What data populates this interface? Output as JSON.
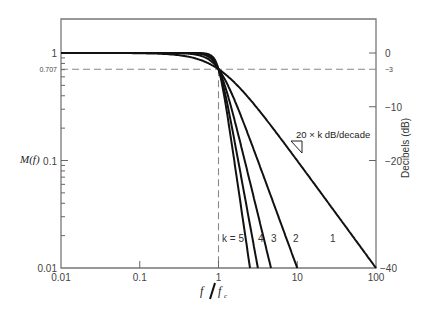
{
  "chart_data": {
    "type": "line",
    "title": "",
    "xlabel": "f / f_c",
    "ylabel": "M(f)",
    "y2label": "Decibels (dB)",
    "xscale": "log",
    "yscale": "log",
    "xlim": [
      0.01,
      100
    ],
    "ylim": [
      0.01,
      1.5
    ],
    "grid": false,
    "legend": "none (inline curve labels)",
    "x_ticks": [
      {
        "value": 0.01,
        "label": "0.01"
      },
      {
        "value": 0.1,
        "label": "0.1"
      },
      {
        "value": 1,
        "label": "1"
      },
      {
        "value": 10,
        "label": "10"
      },
      {
        "value": 100,
        "label": "100"
      }
    ],
    "y_ticks": [
      {
        "value": 1,
        "label": "1"
      },
      {
        "value": 0.707,
        "label": "0.707"
      },
      {
        "value": 0.1,
        "label": "0.1"
      },
      {
        "value": 0.01,
        "label": "0.01"
      }
    ],
    "y2_ticks": [
      {
        "value": 1,
        "label": "0"
      },
      {
        "value": 0.707,
        "label": "−3"
      },
      {
        "value": 0.3162,
        "label": "−10"
      },
      {
        "value": 0.1,
        "label": "−20"
      },
      {
        "value": 0.01,
        "label": "−40"
      }
    ],
    "reference_lines": [
      {
        "type": "horizontal",
        "value": 0.707,
        "style": "dashed"
      },
      {
        "type": "vertical",
        "value": 1,
        "style": "dashed"
      }
    ],
    "formula": "M(f) = 1 / sqrt(1 + (f/fc)^(2k))",
    "series": [
      {
        "name": "k = 1",
        "label": "1",
        "k": 1,
        "x": [
          0.01,
          0.1,
          0.5,
          1,
          2,
          5,
          10,
          100
        ],
        "values": [
          1.0,
          0.995,
          0.894,
          0.707,
          0.447,
          0.196,
          0.0995,
          0.01
        ],
        "label_at": [
          330,
          242
        ]
      },
      {
        "name": "k = 2",
        "label": "2",
        "k": 2,
        "x": [
          0.01,
          0.1,
          0.5,
          1,
          2,
          5,
          10
        ],
        "values": [
          1.0,
          1.0,
          0.97,
          0.707,
          0.243,
          0.04,
          0.01
        ],
        "label_at": [
          293,
          242
        ]
      },
      {
        "name": "k = 3",
        "label": "3",
        "k": 3,
        "x": [
          0.01,
          0.1,
          0.5,
          1,
          2,
          4.64
        ],
        "values": [
          1.0,
          1.0,
          0.992,
          0.707,
          0.124,
          0.01
        ],
        "label_at": [
          271,
          242
        ]
      },
      {
        "name": "k = 4",
        "label": "4",
        "k": 4,
        "x": [
          0.01,
          0.1,
          0.5,
          1,
          2,
          3.16
        ],
        "values": [
          1.0,
          1.0,
          0.998,
          0.707,
          0.062,
          0.01
        ],
        "label_at": [
          258,
          242
        ]
      },
      {
        "name": "k = 5",
        "label": "k = 5",
        "k": 5,
        "x": [
          0.01,
          0.1,
          0.5,
          1,
          2,
          2.51
        ],
        "values": [
          1.0,
          1.0,
          1.0,
          0.707,
          0.031,
          0.01
        ],
        "label_at": [
          222,
          242
        ]
      }
    ],
    "annotations": [
      {
        "text": "20 × k dB/decade",
        "x_px": 296,
        "y_px": 138
      }
    ]
  },
  "labels": {
    "y_axis": "M(f)",
    "x_axis_f": "f",
    "x_axis_fc": "f",
    "x_axis_fc_sub": "c",
    "y2_axis": "Decibels (dB)",
    "slope_annotation": "20 × k dB/decade"
  }
}
